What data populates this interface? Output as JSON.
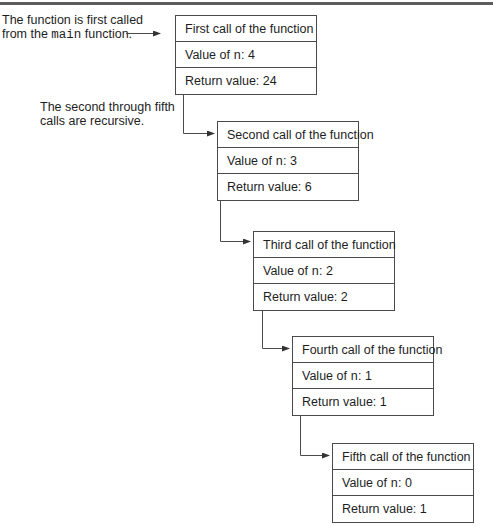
{
  "annotations": {
    "first_call": {
      "line1": "The function is first called",
      "line2_prefix": "from the ",
      "line2_code": "main",
      "line2_suffix": " function."
    },
    "recursive": {
      "line1": "The second through fifth",
      "line2": "calls are recursive."
    }
  },
  "calls": [
    {
      "title": "First call of the function",
      "value_label": "Value of ",
      "var": "n",
      "value": ": 4",
      "return_label": "Return value: 24"
    },
    {
      "title": "Second call of the function",
      "value_label": "Value of ",
      "var": "n",
      "value": ": 3",
      "return_label": "Return value: 6"
    },
    {
      "title": "Third call of the function",
      "value_label": "Value of ",
      "var": "n",
      "value": ": 2",
      "return_label": "Return value: 2"
    },
    {
      "title": "Fourth call of the function",
      "value_label": "Value of ",
      "var": "n",
      "value": ": 1",
      "return_label": "Return value: 1"
    },
    {
      "title": "Fifth call of the function",
      "value_label": "Value of ",
      "var": "n",
      "value": ": 0",
      "return_label": "Return value: 1"
    }
  ],
  "colors": {
    "line": "#4a4a4a",
    "text": "#1e1e1e",
    "rule": "#5d5d5d"
  }
}
